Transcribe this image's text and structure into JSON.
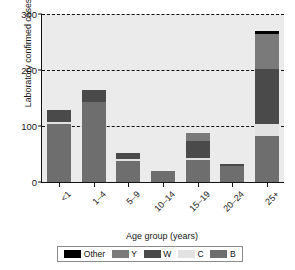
{
  "chart_data": {
    "type": "bar",
    "subtype": "stacked-bar",
    "title": "",
    "xlabel": "Age group (years)",
    "ylabel": "Laboratory confirmed cases",
    "categories": [
      "<1",
      "1–4",
      "5–9",
      "10–14",
      "15–19",
      "20–24",
      "25+"
    ],
    "ylim": [
      0,
      300
    ],
    "yticks": [
      0,
      100,
      200,
      300
    ],
    "ytick_labels": [
      "0",
      "100",
      "200",
      "300"
    ],
    "grid": "horizontal-dashed",
    "legend_position": "bottom",
    "series": [
      {
        "name": "B",
        "color": "#6e6e6e",
        "values": [
          103,
          143,
          38,
          20,
          40,
          28,
          82
        ]
      },
      {
        "name": "C",
        "color": "#e2e2e2",
        "values": [
          4,
          0,
          3,
          0,
          3,
          0,
          22
        ]
      },
      {
        "name": "W",
        "color": "#4a4a4a",
        "values": [
          21,
          21,
          10,
          0,
          30,
          4,
          97
        ]
      },
      {
        "name": "Y",
        "color": "#7a7a7a",
        "values": [
          0,
          0,
          0,
          0,
          15,
          0,
          63
        ]
      },
      {
        "name": "Other",
        "color": "#000000",
        "values": [
          0,
          0,
          0,
          0,
          0,
          0,
          6
        ]
      }
    ],
    "totals": [
      128,
      164,
      51,
      20,
      88,
      32,
      270
    ]
  },
  "legend": {
    "items": [
      {
        "label": "Other",
        "color": "#000000"
      },
      {
        "label": "Y",
        "color": "#7a7a7a"
      },
      {
        "label": "W",
        "color": "#4a4a4a"
      },
      {
        "label": "C",
        "color": "#e2e2e2"
      },
      {
        "label": "B",
        "color": "#6e6e6e"
      }
    ]
  },
  "style": {
    "plot_background": "#ebebeb",
    "figure_background": "#ffffff",
    "axis_color": "#141414",
    "grid_color": "#111111"
  },
  "caption": ""
}
